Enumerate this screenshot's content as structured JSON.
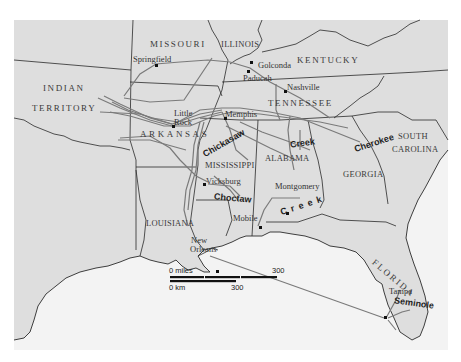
{
  "map": {
    "title": "Indian Removal routes, Southeastern United States",
    "colors": {
      "land": "#dedede",
      "water": "#f3f3f3",
      "border": "#2a2a2a",
      "route": "#7a7a7a",
      "background": "#ffffff"
    },
    "regions": [
      {
        "id": "missouri",
        "label": "MISSOURI"
      },
      {
        "id": "illinois",
        "label": "ILLINOIS"
      },
      {
        "id": "kentucky",
        "label": "KENTUCKY"
      },
      {
        "id": "indian-territory-1",
        "label": "INDIAN"
      },
      {
        "id": "indian-territory-2",
        "label": "TERRITORY"
      },
      {
        "id": "tennessee",
        "label": "TENNESSEE"
      },
      {
        "id": "arkansas",
        "label": "ARKANSAS"
      },
      {
        "id": "mississippi",
        "label": "MISSISSIPPI"
      },
      {
        "id": "alabama",
        "label": "ALABAMA"
      },
      {
        "id": "georgia",
        "label": "GEORGIA"
      },
      {
        "id": "south-carolina-1",
        "label": "SOUTH"
      },
      {
        "id": "south-carolina-2",
        "label": "CAROLINA"
      },
      {
        "id": "louisiana",
        "label": "LOUISIANA"
      },
      {
        "id": "florida",
        "label": "FLORIDA"
      }
    ],
    "cities": [
      {
        "id": "springfield",
        "label": "Springfield"
      },
      {
        "id": "golconda",
        "label": "Golconda"
      },
      {
        "id": "paducah",
        "label": "Paducah"
      },
      {
        "id": "nashville",
        "label": "Nashville"
      },
      {
        "id": "little-rock-1",
        "label": "Little"
      },
      {
        "id": "little-rock-2",
        "label": "Rock"
      },
      {
        "id": "memphis",
        "label": "Memphis"
      },
      {
        "id": "vicksburg",
        "label": "Vicksburg"
      },
      {
        "id": "montgomery",
        "label": "Montgomery"
      },
      {
        "id": "mobile",
        "label": "Mobile"
      },
      {
        "id": "new-orleans-1",
        "label": "New"
      },
      {
        "id": "new-orleans-2",
        "label": "Orleans"
      },
      {
        "id": "tampa",
        "label": "Tampa"
      }
    ],
    "tribes": [
      {
        "id": "chickasaw",
        "label": "Chickasaw"
      },
      {
        "id": "creek-1",
        "label": "Creek"
      },
      {
        "id": "creek-2",
        "label": "C  r  e  e  k"
      },
      {
        "id": "cherokee",
        "label": "Cherokee"
      },
      {
        "id": "choctaw",
        "label": "Choctaw"
      },
      {
        "id": "seminole",
        "label": "Seminole"
      }
    ],
    "scale": {
      "miles_start": "0 miles",
      "miles_end": "300",
      "km_start": "0 km",
      "km_end": "300"
    }
  }
}
